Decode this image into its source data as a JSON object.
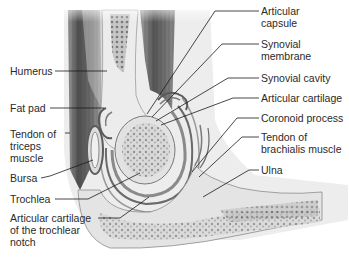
{
  "diagram": {
    "labels_left": [
      {
        "id": "humerus",
        "lines": [
          "Humerus"
        ],
        "x": 10,
        "y": 65
      },
      {
        "id": "fat-pad",
        "lines": [
          "Fat pad"
        ],
        "x": 10,
        "y": 102
      },
      {
        "id": "tendon-triceps",
        "lines": [
          "Tendon of",
          "triceps",
          "muscle"
        ],
        "x": 10,
        "y": 130
      },
      {
        "id": "bursa",
        "lines": [
          "Bursa"
        ],
        "x": 10,
        "y": 172
      },
      {
        "id": "trochlea",
        "lines": [
          "Trochlea"
        ],
        "x": 10,
        "y": 195
      },
      {
        "id": "articular-cartilage-trochlear-notch",
        "lines": [
          "Articular cartilage",
          "of the trochlear",
          "notch"
        ],
        "x": 10,
        "y": 214
      }
    ],
    "labels_right": [
      {
        "id": "articular-capsule",
        "lines": [
          "Articular",
          "capsule"
        ],
        "x": 261,
        "y": 5
      },
      {
        "id": "synovial-membrane",
        "lines": [
          "Synovial",
          "membrane"
        ],
        "x": 261,
        "y": 39
      },
      {
        "id": "synovial-cavity",
        "lines": [
          "Synovial cavity"
        ],
        "x": 261,
        "y": 72
      },
      {
        "id": "articular-cartilage",
        "lines": [
          "Articular cartilage"
        ],
        "x": 261,
        "y": 92
      },
      {
        "id": "coronoid-process",
        "lines": [
          "Coronoid process"
        ],
        "x": 261,
        "y": 112
      },
      {
        "id": "tendon-brachialis",
        "lines": [
          "Tendon of",
          "brachialis muscle"
        ],
        "x": 261,
        "y": 131
      },
      {
        "id": "ulna",
        "lines": [
          "Ulna"
        ],
        "x": 261,
        "y": 164
      }
    ],
    "colors": {
      "muscle": "#6a6a6a",
      "bone": "#e6e6e6",
      "bone_texture": "#8a8a8a",
      "cartilage": "#9a9a9a",
      "leader": "#1a1a1a",
      "text": "#2a2a2a"
    }
  }
}
